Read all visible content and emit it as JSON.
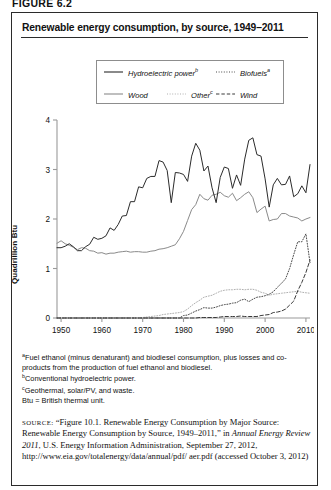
{
  "figure_label": "FIGURE 6.2",
  "title": "Renewable energy consumption, by source, 1949–2011",
  "legend": {
    "items": [
      {
        "label": "Hydroelectric power",
        "sup": "b",
        "style": "solid-black"
      },
      {
        "label": "Biofuels",
        "sup": "a",
        "style": "dotted-dark"
      },
      {
        "label": "Wood",
        "sup": "",
        "style": "solid-gray"
      },
      {
        "label": "Other",
        "sup": "c",
        "style": "dotted-light"
      },
      {
        "label": "Wind",
        "sup": "",
        "style": "dashed-dark"
      }
    ]
  },
  "footnotes": [
    {
      "marker": "a",
      "text": "Fuel ethanol (minus denaturant) and biodiesel consumption, plus losses and co-products from the production of fuel ethanol and biodiesel."
    },
    {
      "marker": "b",
      "text": "Conventional hydroelectric power."
    },
    {
      "marker": "c",
      "text": "Geothermal, solar/PV, and waste."
    },
    {
      "marker": "",
      "text": "Btu = British thermal unit."
    }
  ],
  "source": {
    "label": "SOURCE:",
    "text_1": "“Figure 10.1. Renewable Energy Consumption by Major Source: Renewable Energy Consumption by Source, 1949–2011,” in ",
    "italic": "Annual Energy Review 2011",
    "text_2": ", U.S. Energy Information Administration, September 27, 2012, http://www.eia.gov/totalenergy/data/annual/pdf/ aer.pdf (accessed October 3, 2012)"
  },
  "chart_data": {
    "type": "line",
    "title": "Renewable energy consumption, by source, 1949–2011",
    "xlabel": "",
    "ylabel": "Quadrillion Btu",
    "xlim": [
      1949,
      2011
    ],
    "ylim": [
      0,
      4
    ],
    "yticks": [
      0,
      1,
      2,
      3,
      4
    ],
    "xticks": [
      1950,
      1960,
      1970,
      1980,
      1990,
      2000,
      2010
    ],
    "grid": false,
    "legend_position": "above-plot",
    "x": [
      1949,
      1950,
      1951,
      1952,
      1953,
      1954,
      1955,
      1956,
      1957,
      1958,
      1959,
      1960,
      1961,
      1962,
      1963,
      1964,
      1965,
      1966,
      1967,
      1968,
      1969,
      1970,
      1971,
      1972,
      1973,
      1974,
      1975,
      1976,
      1977,
      1978,
      1979,
      1980,
      1981,
      1982,
      1983,
      1984,
      1985,
      1986,
      1987,
      1988,
      1989,
      1990,
      1991,
      1992,
      1993,
      1994,
      1995,
      1996,
      1997,
      1998,
      1999,
      2000,
      2001,
      2002,
      2003,
      2004,
      2005,
      2006,
      2007,
      2008,
      2009,
      2010,
      2011
    ],
    "series": [
      {
        "name": "Hydroelectric power",
        "sup": "b",
        "color": "#2b2b2b",
        "style": "solid",
        "values": [
          1.42,
          1.42,
          1.45,
          1.5,
          1.44,
          1.36,
          1.36,
          1.44,
          1.49,
          1.63,
          1.59,
          1.61,
          1.66,
          1.82,
          1.77,
          1.89,
          2.06,
          2.07,
          2.35,
          2.35,
          2.65,
          2.63,
          2.82,
          2.86,
          2.86,
          3.18,
          3.15,
          2.98,
          2.33,
          2.94,
          2.93,
          2.9,
          2.76,
          3.27,
          3.53,
          3.39,
          2.97,
          3.07,
          2.63,
          2.33,
          2.84,
          3.05,
          3.02,
          2.62,
          2.89,
          2.68,
          3.21,
          3.59,
          3.64,
          3.3,
          3.27,
          2.81,
          2.24,
          2.69,
          2.82,
          2.69,
          2.7,
          2.87,
          2.45,
          2.51,
          2.67,
          2.53,
          3.1
        ]
      },
      {
        "name": "Wood",
        "sup": "",
        "color": "#8a8a8a",
        "style": "solid",
        "values": [
          1.51,
          1.56,
          1.5,
          1.47,
          1.43,
          1.38,
          1.42,
          1.41,
          1.36,
          1.35,
          1.31,
          1.32,
          1.29,
          1.31,
          1.31,
          1.33,
          1.34,
          1.35,
          1.33,
          1.34,
          1.34,
          1.33,
          1.33,
          1.35,
          1.36,
          1.39,
          1.4,
          1.42,
          1.45,
          1.48,
          1.6,
          1.75,
          1.97,
          2.19,
          2.29,
          2.5,
          2.41,
          2.38,
          2.48,
          2.5,
          2.54,
          2.47,
          2.44,
          2.52,
          2.37,
          2.43,
          2.5,
          2.55,
          2.43,
          2.13,
          2.2,
          2.26,
          1.96,
          1.99,
          2.0,
          2.11,
          2.11,
          2.06,
          2.04,
          2.02,
          1.96,
          2.0,
          2.03
        ]
      },
      {
        "name": "Biofuels",
        "sup": "a",
        "color": "#4a4a4a",
        "style": "dotted",
        "values": [
          0,
          0,
          0,
          0,
          0,
          0,
          0,
          0,
          0,
          0,
          0,
          0,
          0,
          0,
          0,
          0,
          0,
          0,
          0,
          0,
          0,
          0,
          0,
          0,
          0,
          0,
          0,
          0,
          0,
          0,
          0,
          0.05,
          0.06,
          0.1,
          0.14,
          0.17,
          0.21,
          0.2,
          0.2,
          0.22,
          0.25,
          0.27,
          0.28,
          0.3,
          0.31,
          0.36,
          0.38,
          0.33,
          0.38,
          0.42,
          0.43,
          0.45,
          0.48,
          0.53,
          0.62,
          0.7,
          0.79,
          1.0,
          1.28,
          1.54,
          1.54,
          1.7,
          1.12
        ]
      },
      {
        "name": "Other",
        "sup": "c",
        "color": "#b0b0b0",
        "style": "dotted",
        "values": [
          0,
          0,
          0,
          0,
          0,
          0,
          0,
          0,
          0,
          0,
          0,
          0,
          0,
          0,
          0,
          0,
          0,
          0,
          0,
          0,
          0,
          0.01,
          0.02,
          0.03,
          0.04,
          0.05,
          0.07,
          0.08,
          0.09,
          0.1,
          0.11,
          0.13,
          0.18,
          0.25,
          0.31,
          0.36,
          0.42,
          0.44,
          0.46,
          0.5,
          0.54,
          0.56,
          0.57,
          0.57,
          0.58,
          0.58,
          0.57,
          0.58,
          0.58,
          0.56,
          0.52,
          0.5,
          0.46,
          0.48,
          0.49,
          0.5,
          0.51,
          0.52,
          0.53,
          0.54,
          0.52,
          0.51,
          0.5
        ]
      },
      {
        "name": "Wind",
        "sup": "",
        "color": "#3a3a3a",
        "style": "dashed",
        "values": [
          0,
          0,
          0,
          0,
          0,
          0,
          0,
          0,
          0,
          0,
          0,
          0,
          0,
          0,
          0,
          0,
          0,
          0,
          0,
          0,
          0,
          0,
          0,
          0,
          0,
          0,
          0,
          0,
          0,
          0,
          0,
          0,
          0,
          0.0,
          0.0,
          0.01,
          0.01,
          0.01,
          0.01,
          0.01,
          0.02,
          0.03,
          0.03,
          0.03,
          0.03,
          0.04,
          0.03,
          0.03,
          0.03,
          0.03,
          0.05,
          0.06,
          0.07,
          0.11,
          0.12,
          0.14,
          0.18,
          0.26,
          0.34,
          0.55,
          0.72,
          0.92,
          1.17
        ]
      }
    ]
  }
}
